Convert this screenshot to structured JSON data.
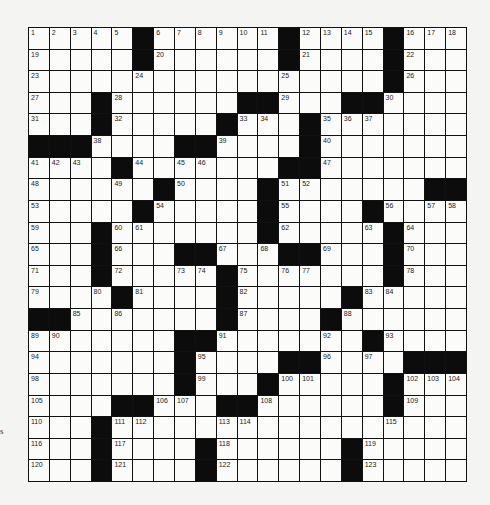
{
  "puzzle": {
    "rows": 21,
    "cols": 21,
    "legend": "# = black square, . = empty white square, number = numbered white square",
    "grid": [
      [
        "1",
        "2",
        "3",
        "4",
        "5",
        "#",
        "6",
        "7",
        "8",
        "9",
        "10",
        "11",
        "#",
        "12",
        "13",
        "14",
        "15",
        "#",
        "16",
        "17",
        "18"
      ],
      [
        "19",
        ".",
        ".",
        ".",
        ".",
        "#",
        "20",
        ".",
        ".",
        ".",
        ".",
        ".",
        "#",
        "21",
        ".",
        ".",
        ".",
        "#",
        "22",
        ".",
        "."
      ],
      [
        "23",
        ".",
        ".",
        ".",
        ".",
        "24",
        ".",
        ".",
        ".",
        ".",
        ".",
        ".",
        "25",
        ".",
        ".",
        ".",
        ".",
        "#",
        "26",
        ".",
        "."
      ],
      [
        "27",
        ".",
        ".",
        "#",
        "28",
        ".",
        ".",
        ".",
        ".",
        ".",
        "#",
        "#",
        "29",
        ".",
        ".",
        "#",
        "#",
        "30",
        ".",
        ".",
        "."
      ],
      [
        "31",
        ".",
        ".",
        "#",
        "32",
        ".",
        ".",
        ".",
        ".",
        "#",
        "33",
        "34",
        ".",
        "#",
        "35",
        "36",
        "37",
        ".",
        ".",
        ".",
        "."
      ],
      [
        "#",
        "#",
        "#",
        "38",
        ".",
        ".",
        ".",
        "#",
        "#",
        "39",
        ".",
        ".",
        ".",
        "#",
        "40",
        ".",
        ".",
        ".",
        ".",
        ".",
        "."
      ],
      [
        "41",
        "42",
        "43",
        ".",
        "#",
        "44",
        ".",
        "45",
        "46",
        ".",
        ".",
        ".",
        "#",
        "#",
        "47",
        ".",
        ".",
        ".",
        ".",
        ".",
        "."
      ],
      [
        "48",
        ".",
        ".",
        ".",
        "49",
        ".",
        "#",
        "50",
        ".",
        ".",
        ".",
        "#",
        "51",
        "52",
        ".",
        ".",
        ".",
        ".",
        ".",
        "#",
        "#"
      ],
      [
        "53",
        ".",
        ".",
        ".",
        ".",
        "#",
        "54",
        ".",
        ".",
        ".",
        ".",
        "#",
        "55",
        ".",
        ".",
        ".",
        "#",
        "56",
        ".",
        "57",
        "58"
      ],
      [
        "59",
        ".",
        ".",
        "#",
        "60",
        "61",
        ".",
        ".",
        ".",
        ".",
        ".",
        "#",
        "62",
        ".",
        ".",
        ".",
        "63",
        "#",
        "64",
        ".",
        "."
      ],
      [
        "65",
        ".",
        ".",
        "#",
        "66",
        ".",
        ".",
        "#",
        "#",
        "67",
        ".",
        "68",
        "#",
        "#",
        "69",
        ".",
        ".",
        "#",
        "70",
        ".",
        "."
      ],
      [
        "71",
        ".",
        ".",
        "#",
        "72",
        ".",
        ".",
        "73",
        "74",
        "#",
        "75",
        ".",
        "76",
        "77",
        ".",
        ".",
        ".",
        "#",
        "78",
        ".",
        "."
      ],
      [
        "79",
        ".",
        ".",
        "80",
        "#",
        "81",
        ".",
        ".",
        ".",
        "#",
        "82",
        ".",
        ".",
        ".",
        ".",
        "#",
        "83",
        "84",
        ".",
        ".",
        "."
      ],
      [
        "#",
        "#",
        "85",
        ".",
        "86",
        ".",
        ".",
        ".",
        ".",
        "#",
        "87",
        ".",
        ".",
        ".",
        "#",
        "88",
        ".",
        ".",
        ".",
        ".",
        "."
      ],
      [
        "89",
        "90",
        ".",
        ".",
        ".",
        ".",
        ".",
        "#",
        "#",
        "91",
        ".",
        ".",
        ".",
        ".",
        "92",
        ".",
        "#",
        "93",
        ".",
        ".",
        "."
      ],
      [
        "94",
        ".",
        ".",
        ".",
        ".",
        ".",
        ".",
        "#",
        "95",
        ".",
        ".",
        ".",
        "#",
        "#",
        "96",
        ".",
        "97",
        ".",
        "#",
        "#",
        "#"
      ],
      [
        "98",
        ".",
        ".",
        ".",
        ".",
        ".",
        ".",
        "#",
        "99",
        ".",
        ".",
        "#",
        "100",
        "101",
        ".",
        ".",
        ".",
        "#",
        "102",
        "103",
        "104"
      ],
      [
        "105",
        ".",
        ".",
        ".",
        "#",
        "#",
        "106",
        "107",
        ".",
        "#",
        "#",
        "108",
        ".",
        ".",
        ".",
        ".",
        ".",
        "#",
        "109",
        ".",
        "."
      ],
      [
        "110",
        ".",
        ".",
        "#",
        "111",
        "112",
        ".",
        ".",
        ".",
        "113",
        "114",
        ".",
        ".",
        ".",
        ".",
        ".",
        ".",
        "115",
        ".",
        ".",
        "."
      ],
      [
        "116",
        ".",
        ".",
        "#",
        "117",
        ".",
        ".",
        ".",
        "#",
        "118",
        ".",
        ".",
        ".",
        ".",
        ".",
        "#",
        "119",
        ".",
        ".",
        ".",
        "."
      ],
      [
        "120",
        ".",
        ".",
        "#",
        "121",
        ".",
        ".",
        ".",
        "#",
        "122",
        ".",
        ".",
        ".",
        ".",
        ".",
        "#",
        "123",
        ".",
        ".",
        ".",
        "."
      ]
    ]
  },
  "margin_text": "s",
  "colors": {
    "black_square": "#0c0c0c",
    "white_square": "#fbfbf9",
    "background": "#f4f4f2"
  }
}
